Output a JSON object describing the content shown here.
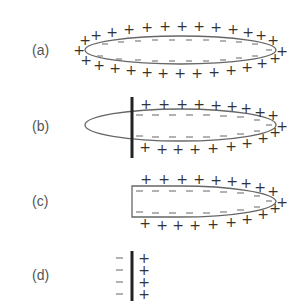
{
  "figure": {
    "panels": [
      {
        "id": "a",
        "label": "(a)",
        "shape": "full-ellipse",
        "outer_charge": "+",
        "inner_charge": "-"
      },
      {
        "id": "b",
        "label": "(b)",
        "shape": "ellipse-with-plane-cut",
        "outer_charge": "+",
        "inner_charge": "-"
      },
      {
        "id": "c",
        "label": "(c)",
        "shape": "truncated-ellipse",
        "outer_charge": "+",
        "inner_charge": "-"
      },
      {
        "id": "d",
        "label": "(d)",
        "shape": "plane-double-layer",
        "left_charge": "-",
        "right_charge": "+",
        "rows": 4
      }
    ],
    "colors": {
      "outline": "#666666",
      "plane": "#222222",
      "plus": "#333333",
      "minus": "#777777",
      "label": "#555555"
    },
    "symbols": {
      "plus": "+",
      "minus": "−"
    }
  }
}
